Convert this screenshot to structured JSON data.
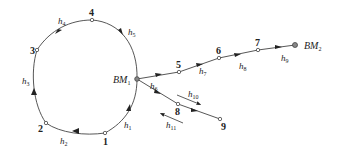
{
  "diagram": {
    "title": "",
    "type": "leveling network",
    "benchmarks": [
      {
        "id": "BM1",
        "label": "BM",
        "sub": "1",
        "x": 137,
        "y": 79
      },
      {
        "id": "BM2",
        "label": "BM",
        "sub": "2",
        "x": 295,
        "y": 45
      }
    ],
    "points": [
      {
        "id": "1",
        "label": "1",
        "x": 105,
        "y": 133
      },
      {
        "id": "2",
        "label": "2",
        "x": 46,
        "y": 123
      },
      {
        "id": "3",
        "label": "3",
        "x": 37,
        "y": 50
      },
      {
        "id": "4",
        "label": "4",
        "x": 92,
        "y": 20
      },
      {
        "id": "5",
        "label": "5",
        "x": 179,
        "y": 72
      },
      {
        "id": "6",
        "label": "6",
        "x": 219,
        "y": 58
      },
      {
        "id": "7",
        "label": "7",
        "x": 258,
        "y": 50
      },
      {
        "id": "8",
        "label": "8",
        "x": 178,
        "y": 104
      },
      {
        "id": "9",
        "label": "9",
        "x": 220,
        "y": 119
      }
    ],
    "segments": [
      {
        "label": "h",
        "sub": "1",
        "from": "BM1",
        "to": "1"
      },
      {
        "label": "h",
        "sub": "2",
        "from": "1",
        "to": "2"
      },
      {
        "label": "h",
        "sub": "3",
        "from": "2",
        "to": "3"
      },
      {
        "label": "h",
        "sub": "4",
        "from": "3",
        "to": "4"
      },
      {
        "label": "h",
        "sub": "5",
        "from": "4",
        "to": "BM1"
      },
      {
        "label": "h",
        "sub": "6",
        "from": "BM1",
        "to": "5"
      },
      {
        "label": "h",
        "sub": "7",
        "from": "5",
        "to": "6"
      },
      {
        "label": "h",
        "sub": "8",
        "from": "6",
        "to": "7"
      },
      {
        "label": "h",
        "sub": "9",
        "from": "7",
        "to": "BM2"
      },
      {
        "label": "h",
        "sub": "10",
        "from": "8",
        "to": "9"
      },
      {
        "label": "h",
        "sub": "11",
        "from": "9",
        "to": "8"
      }
    ],
    "colors": {
      "line": "#444444",
      "text": "#222222",
      "background": "#ffffff"
    }
  }
}
